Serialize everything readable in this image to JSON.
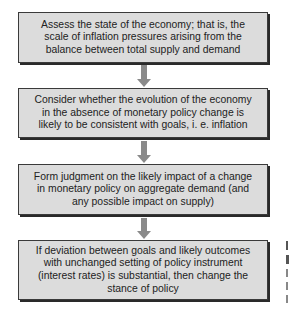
{
  "diagram": {
    "type": "flowchart",
    "direction": "top-to-bottom",
    "colors": {
      "box_fill": "#dcdcdc",
      "box_border": "#3a3a3a",
      "box_shadow": "#2a2a2a",
      "arrow": "#8a8a8a",
      "text": "#222222"
    },
    "steps": [
      {
        "id": 1,
        "text": "Assess the state of the economy; that is, the scale of inflation pressures arising from the balance between total supply and demand"
      },
      {
        "id": 2,
        "text": "Consider whether the evolution of the economy in the absence of monetary policy change is likely to be consistent with goals, i. e. inflation"
      },
      {
        "id": 3,
        "text": "Form judgment on the likely impact of a change in monetary policy on aggregate demand (and any possible impact on supply)"
      },
      {
        "id": 4,
        "text": "If deviation between goals and likely outcomes with unchanged setting of policy instrument (interest rates) is substantial, then change the stance of policy"
      }
    ],
    "connections": [
      {
        "from": 1,
        "to": 2
      },
      {
        "from": 2,
        "to": 3
      },
      {
        "from": 3,
        "to": 4
      }
    ]
  }
}
